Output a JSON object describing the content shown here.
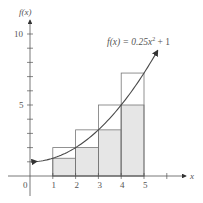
{
  "chart_data": {
    "type": "bar",
    "title": "",
    "function_label": "f(x) = 0.25x² + 1",
    "function": {
      "a": 0.25,
      "c": 1
    },
    "xlabel": "x",
    "ylabel": "f(x)",
    "x_ticks": [
      "0",
      "1",
      "2",
      "3",
      "4",
      "5"
    ],
    "y_ticks_labeled": [
      "5",
      "10"
    ],
    "xlim": [
      0,
      6.5
    ],
    "ylim": [
      0,
      10.8
    ],
    "intervals": [
      [
        1,
        2
      ],
      [
        2,
        3
      ],
      [
        3,
        4
      ],
      [
        4,
        5
      ]
    ],
    "series": [
      {
        "name": "lower (inscribed) rectangles",
        "values": [
          1.25,
          2,
          3.25,
          5
        ],
        "fill": "#e6e6e6"
      },
      {
        "name": "upper (circumscribed) rectangles",
        "values": [
          2,
          3.25,
          5,
          7.25
        ],
        "fill": "none"
      }
    ],
    "curve_domain": [
      0.3,
      5.6
    ],
    "grid": false
  },
  "labels": {
    "y_axis": "f(x)",
    "x_axis": "x",
    "origin": "0",
    "x1": "1",
    "x2": "2",
    "x3": "3",
    "x4": "4",
    "x5": "5",
    "y5": "5",
    "y10": "10",
    "fx_prefix": "f(x) = 0.25x",
    "fx_exp": "2",
    "fx_suffix": " + 1"
  },
  "colors": {
    "axis": "#555555",
    "curve": "#4a4a4a",
    "shade": "#e6e6e6",
    "rect_stroke": "#777777"
  }
}
